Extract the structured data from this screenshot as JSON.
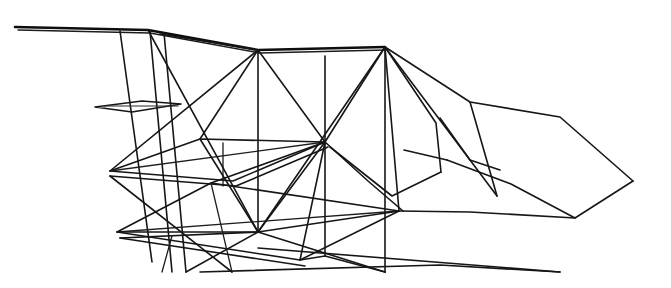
{
  "figure": {
    "background_color": "#ffffff",
    "ink_color": "#161616",
    "width": 671,
    "height": 288,
    "line_count": 52
  },
  "chart_data": {
    "type": "line",
    "xlabel": "",
    "ylabel": "",
    "xlim": [
      0,
      671
    ],
    "ylim": [
      0,
      288
    ],
    "grid": false,
    "legend": "none"
  },
  "geometry": {
    "nodes": [
      {
        "id": "spar-left-tip",
        "label": "left spar tip",
        "x": 15,
        "y": 27
      },
      {
        "id": "spar-kink",
        "label": "spar kink",
        "x": 148,
        "y": 30
      },
      {
        "id": "apex-front",
        "label": "front upper apex",
        "x": 258,
        "y": 50
      },
      {
        "id": "apex-rear",
        "label": "rear upper apex",
        "x": 385,
        "y": 47
      },
      {
        "id": "mid-node",
        "label": "central hub",
        "x": 325,
        "y": 142
      },
      {
        "id": "low-node",
        "label": "lower hub",
        "x": 258,
        "y": 232
      },
      {
        "id": "tail-tip",
        "label": "tail point",
        "x": 633,
        "y": 181
      },
      {
        "id": "tail-upper",
        "label": "tail upper bend",
        "x": 560,
        "y": 117
      },
      {
        "id": "tail-lower",
        "label": "tail lower bend",
        "x": 575,
        "y": 218
      },
      {
        "id": "plane2-left",
        "label": "mid plane left corner",
        "x": 110,
        "y": 171
      },
      {
        "id": "plane2-top",
        "label": "mid plane top corner",
        "x": 200,
        "y": 139
      },
      {
        "id": "plane2-bot",
        "label": "mid plane bottom corner",
        "x": 233,
        "y": 181
      },
      {
        "id": "plane3-left",
        "label": "low plane left corner",
        "x": 117,
        "y": 232
      },
      {
        "id": "plane3-top",
        "label": "low plane top corner",
        "x": 211,
        "y": 183
      },
      {
        "id": "plane3-right",
        "label": "low plane right corner",
        "x": 399,
        "y": 211
      },
      {
        "id": "plane3-bot",
        "label": "low plane bottom corner",
        "x": 300,
        "y": 260
      },
      {
        "id": "plane1-left",
        "label": "small plane left corner",
        "x": 95,
        "y": 107
      },
      {
        "id": "plane1-right",
        "label": "small plane right corner",
        "x": 181,
        "y": 104
      }
    ],
    "paths": [
      {
        "id": "top-spar",
        "name": "long upper spar",
        "weight": "heavy",
        "d": "M15,27 L148,30 L258,50 L385,47"
      },
      {
        "id": "top-spar-shadow",
        "name": "upper spar doubling",
        "weight": "thin",
        "d": "M18,30 L150,33 L260,53 L386,50"
      },
      {
        "id": "spar-lower-chord",
        "name": "lower spar chord",
        "weight": "main",
        "d": "M160,34 L258,50"
      },
      {
        "id": "strut-a",
        "name": "vertical strut A",
        "weight": "main",
        "d": "M120,31 L152,262"
      },
      {
        "id": "strut-b",
        "name": "vertical strut B",
        "weight": "main",
        "d": "M150,31 L172,272"
      },
      {
        "id": "strut-c",
        "name": "vertical strut C",
        "weight": "main",
        "d": "M164,33 L186,272"
      },
      {
        "id": "strut-d",
        "name": "vertical strut D",
        "weight": "main",
        "d": "M258,50 L258,232"
      },
      {
        "id": "strut-e",
        "name": "vertical strut E",
        "weight": "main",
        "d": "M325,56 L325,256"
      },
      {
        "id": "strut-f",
        "name": "vertical strut F",
        "weight": "main",
        "d": "M385,47 L385,272"
      },
      {
        "id": "strut-g",
        "name": "short strut G",
        "weight": "thin",
        "d": "M223,143 L223,186"
      },
      {
        "id": "plane1",
        "name": "small upper plane",
        "weight": "main",
        "d": "M95,107 L142,101 L181,104 L132,112 Z"
      },
      {
        "id": "plane1-b",
        "name": "small plane inner",
        "weight": "hair",
        "d": "M104,106 L178,106"
      },
      {
        "id": "plane2",
        "name": "middle plane",
        "weight": "main",
        "d": "M110,171 L200,139 L325,142 L233,181 Z"
      },
      {
        "id": "plane2-inner",
        "name": "middle plane inner edge",
        "weight": "main",
        "d": "M110,176 L236,186 L328,147"
      },
      {
        "id": "plane2-diag",
        "name": "middle plane diagonal",
        "weight": "thin",
        "d": "M110,171 L325,142"
      },
      {
        "id": "plane3",
        "name": "lower plane",
        "weight": "main",
        "d": "M117,232 L211,183 L399,211 L300,260 Z"
      },
      {
        "id": "plane3-inner",
        "name": "lower plane inner edge",
        "weight": "main",
        "d": "M120,238 L305,266"
      },
      {
        "id": "plane3-diag",
        "name": "lower plane diagonal",
        "weight": "thin",
        "d": "M117,232 L399,211"
      },
      {
        "id": "brace-1",
        "name": "brace front apex to hub",
        "weight": "main",
        "d": "M258,50 L325,142"
      },
      {
        "id": "brace-2",
        "name": "brace front apex to plane2 left",
        "weight": "main",
        "d": "M258,50 L200,139"
      },
      {
        "id": "brace-3",
        "name": "brace front apex down-left",
        "weight": "main",
        "d": "M258,50 L110,171"
      },
      {
        "id": "brace-4",
        "name": "brace rear apex to hub",
        "weight": "main",
        "d": "M385,47 L325,142"
      },
      {
        "id": "brace-5",
        "name": "brace rear apex to plane3 right",
        "weight": "main",
        "d": "M385,47 L399,211"
      },
      {
        "id": "brace-6",
        "name": "brace rear apex long sweep",
        "weight": "main",
        "d": "M385,47 L470,160 L497,196"
      },
      {
        "id": "brace-7",
        "name": "brace rear apex to low hub",
        "weight": "main",
        "d": "M385,47 L258,232"
      },
      {
        "id": "brace-8",
        "name": "brace hub to low hub",
        "weight": "main",
        "d": "M325,142 L258,232"
      },
      {
        "id": "brace-9",
        "name": "brace hub to plane3 top",
        "weight": "main",
        "d": "M325,142 L211,183"
      },
      {
        "id": "brace-10",
        "name": "brace hub to plane3 bottom",
        "weight": "main",
        "d": "M325,142 L300,260"
      },
      {
        "id": "brace-11",
        "name": "brace low hub to plane2 top",
        "weight": "main",
        "d": "M258,232 L200,139"
      },
      {
        "id": "brace-12",
        "name": "brace low hub rising right",
        "weight": "main",
        "d": "M258,232 L399,211"
      },
      {
        "id": "brace-13",
        "name": "brace low hub to strut-f base",
        "weight": "main",
        "d": "M258,232 L385,272"
      },
      {
        "id": "brace-14",
        "name": "brace low hub down-left",
        "weight": "main",
        "d": "M258,232 L186,272"
      },
      {
        "id": "brace-15",
        "name": "brace low hub to plane3 left",
        "weight": "main",
        "d": "M258,232 L117,232"
      },
      {
        "id": "brace-16",
        "name": "brace low hub shallow left",
        "weight": "main",
        "d": "M258,232 L120,238"
      },
      {
        "id": "brace-17",
        "name": "diagonal through left bays",
        "weight": "main",
        "d": "M232,272 L110,176"
      },
      {
        "id": "brace-18",
        "name": "diagonal crossing left bays",
        "weight": "main",
        "d": "M148,30 L258,232"
      },
      {
        "id": "brace-19",
        "name": "long lower right spar",
        "weight": "main",
        "d": "M258,248 L560,272"
      },
      {
        "id": "brace-20",
        "name": "lower right spar lower edge",
        "weight": "main",
        "d": "M200,272 L440,265 L560,272"
      },
      {
        "id": "tail-upper-edge",
        "name": "tail upper contour",
        "weight": "main",
        "d": "M385,47 L470,102 L560,117 L633,181"
      },
      {
        "id": "tail-lower-edge",
        "name": "tail lower contour",
        "weight": "main",
        "d": "M399,211 L470,212 L575,218 L633,181"
      },
      {
        "id": "tail-mid-rib",
        "name": "tail mid rib",
        "weight": "main",
        "d": "M447,160 L511,184 L575,218"
      },
      {
        "id": "tail-inner-rib",
        "name": "tail inner rib",
        "weight": "main",
        "d": "M404,150 L447,160"
      },
      {
        "id": "tail-fold",
        "name": "tail fold crease",
        "weight": "main",
        "d": "M470,102 L497,196"
      },
      {
        "id": "tail-fold-2",
        "name": "tail secondary crease",
        "weight": "main",
        "d": "M440,118 L470,160 L500,170"
      },
      {
        "id": "rear-sweep-1",
        "name": "rear sweep upper",
        "weight": "main",
        "d": "M385,47 L436,123 L441,172"
      },
      {
        "id": "rear-sweep-2",
        "name": "rear sweep lower",
        "weight": "main",
        "d": "M325,142 L368,181 L403,211"
      },
      {
        "id": "rear-sweep-3",
        "name": "rear sweep from hub",
        "weight": "main",
        "d": "M330,147 L392,196 L441,172"
      },
      {
        "id": "low-link-1",
        "name": "low link right",
        "weight": "main",
        "d": "M325,256 L385,272"
      },
      {
        "id": "low-link-2",
        "name": "low link to plane3 bottom",
        "weight": "main",
        "d": "M300,260 L325,256"
      },
      {
        "id": "drop-1",
        "name": "dropper left",
        "weight": "thin",
        "d": "M172,236 L162,272"
      },
      {
        "id": "drop-2",
        "name": "dropper mid",
        "weight": "thin",
        "d": "M211,183 L232,272"
      }
    ]
  }
}
